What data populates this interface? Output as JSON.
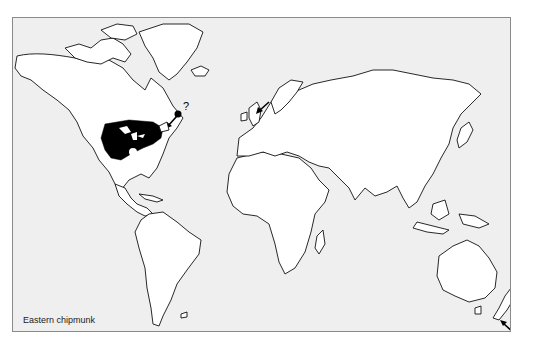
{
  "map": {
    "caption": "Eastern chipmunk",
    "colors": {
      "ocean": "#efefef",
      "land": "#ffffff",
      "native_range": "#000000",
      "border": "#8a8a8a"
    },
    "annotations": {
      "newfoundland_question": "?"
    },
    "regions": [
      {
        "name": "native-range-eastern-north-america",
        "label": "Native range (eastern US & southern Canada)"
      },
      {
        "name": "introduction-newfoundland",
        "label": "Possible introduction (?)"
      },
      {
        "name": "introduction-britain",
        "label": "Introduction arrow"
      },
      {
        "name": "introduction-new-zealand",
        "label": "Introduction arrow"
      }
    ]
  }
}
